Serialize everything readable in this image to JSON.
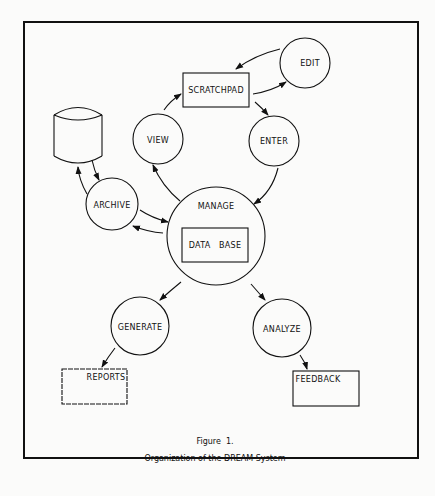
{
  "figure": {
    "number_label": "Figure  1.",
    "caption": "Organization of the DREAM System"
  },
  "nodes": {
    "edit": {
      "label": "EDIT",
      "shape": "circle"
    },
    "scratchpad": {
      "label": "SCRATCHPAD",
      "shape": "rectangle"
    },
    "enter": {
      "label": "ENTER",
      "shape": "circle"
    },
    "view": {
      "label": "VIEW",
      "shape": "circle"
    },
    "storage": {
      "label": "",
      "shape": "cylinder"
    },
    "archive": {
      "label": "ARCHIVE",
      "shape": "circle"
    },
    "manage": {
      "label": "MANAGE",
      "shape": "circle"
    },
    "database": {
      "label": "DATA   BASE",
      "shape": "rectangle"
    },
    "generate": {
      "label": "GENERATE",
      "shape": "circle"
    },
    "analyze": {
      "label": "ANALYZE",
      "shape": "circle"
    },
    "reports": {
      "label": "REPORTS",
      "shape": "rectangle"
    },
    "feedback": {
      "label": "FEEDBACK",
      "shape": "rectangle"
    }
  },
  "edges": [
    {
      "from": "edit",
      "to": "scratchpad"
    },
    {
      "from": "scratchpad",
      "to": "edit"
    },
    {
      "from": "scratchpad",
      "to": "enter"
    },
    {
      "from": "enter",
      "to": "manage"
    },
    {
      "from": "manage",
      "to": "view"
    },
    {
      "from": "view",
      "to": "scratchpad"
    },
    {
      "from": "archive",
      "to": "manage"
    },
    {
      "from": "manage",
      "to": "archive"
    },
    {
      "from": "archive",
      "to": "storage"
    },
    {
      "from": "storage",
      "to": "archive"
    },
    {
      "from": "manage",
      "to": "generate"
    },
    {
      "from": "manage",
      "to": "analyze"
    },
    {
      "from": "generate",
      "to": "reports"
    },
    {
      "from": "analyze",
      "to": "feedback"
    }
  ]
}
